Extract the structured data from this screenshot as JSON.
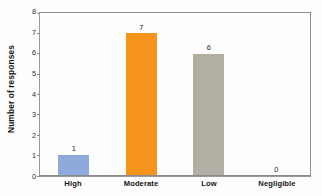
{
  "chart_data": {
    "type": "bar",
    "title": "",
    "xlabel": "",
    "ylabel": "Number of responses",
    "categories": [
      "High",
      "Moderate",
      "Low",
      "Negligible"
    ],
    "values": [
      1,
      7,
      6,
      0
    ],
    "value_labels": [
      "1",
      "7",
      "6",
      "0"
    ],
    "bar_colors": [
      "#8EA9DB",
      "#F7941E",
      "#B3AEA4",
      "#B3AEA4"
    ],
    "ylim": [
      0,
      8
    ],
    "ytick_labels": [
      "0",
      "1",
      "2",
      "3",
      "4",
      "5",
      "6",
      "7",
      "8"
    ],
    "ytick_values": [
      0,
      1,
      2,
      3,
      4,
      5,
      6,
      7,
      8
    ],
    "grid": false,
    "legend": false,
    "legend_position": "none",
    "series": [
      {
        "name": "Number of responses",
        "values": [
          1,
          7,
          6,
          0
        ]
      }
    ]
  },
  "axes": {
    "y_title": "Number of responses",
    "frame_color": "#9a9a9a",
    "tick_color": "#8c8c8c"
  }
}
